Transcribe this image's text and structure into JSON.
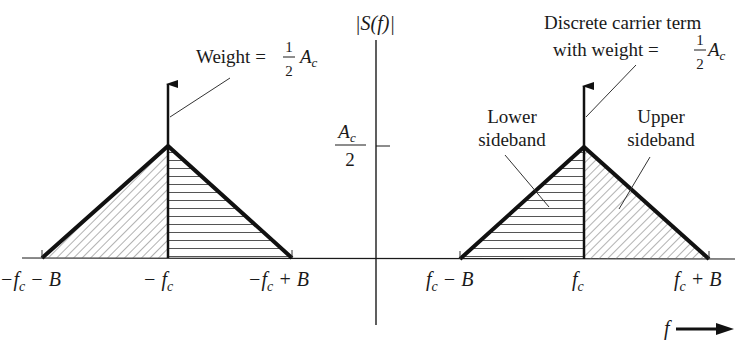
{
  "figure": {
    "y_axis_label": "|S(f)|",
    "x_axis_label": "f",
    "tick_value_label": {
      "numerator": "A",
      "numerator_sub": "c",
      "denominator": "2"
    },
    "x_ticks": {
      "neg_lower": {
        "prefix": "−f",
        "sub": "c",
        "suffix": " − B"
      },
      "neg_center": {
        "prefix": "− f",
        "sub": "c",
        "suffix": ""
      },
      "neg_upper": {
        "prefix": "−f",
        "sub": "c",
        "suffix": " + B"
      },
      "pos_lower": {
        "prefix": "f",
        "sub": "c",
        "suffix": " − B"
      },
      "pos_center": {
        "prefix": "f",
        "sub": "c",
        "suffix": ""
      },
      "pos_upper": {
        "prefix": "f",
        "sub": "c",
        "suffix": " + B"
      }
    },
    "annotations": {
      "left_weight": {
        "text": "Weight = ",
        "frac_num": "1",
        "frac_den": "2",
        "var": "A",
        "sub": "c"
      },
      "right_carrier": {
        "line1": "Discrete carrier term",
        "line2": "with weight = ",
        "frac_num": "1",
        "frac_den": "2",
        "var": "A",
        "sub": "c"
      },
      "lower_sideband": {
        "line1": "Lower",
        "line2": "sideband"
      },
      "upper_sideband": {
        "line1": "Upper",
        "line2": "sideband"
      }
    },
    "colors": {
      "ink": "#1a1a1a",
      "hatch": "#555555",
      "background": "#ffffff"
    }
  }
}
